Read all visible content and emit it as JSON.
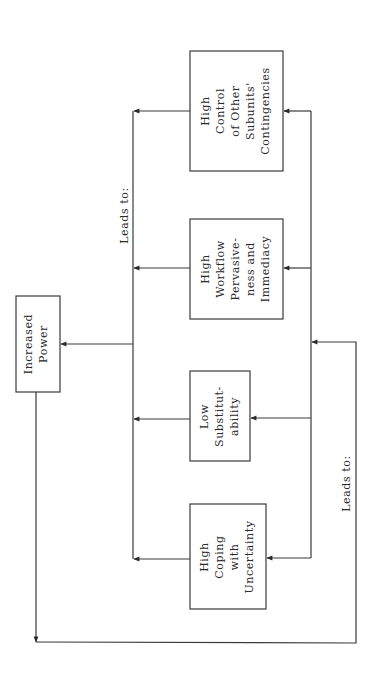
{
  "diagram": {
    "nodes": {
      "power": {
        "lines": [
          "Increased",
          "Power"
        ]
      },
      "coping": {
        "lines": [
          "High",
          "Coping",
          "with",
          "Uncertainty"
        ]
      },
      "substitutability": {
        "lines": [
          "Low",
          "Substitut-",
          "ability"
        ]
      },
      "workflow": {
        "lines": [
          "High",
          "Workflow",
          "Pervasive-",
          "ness and",
          "Immediacy"
        ]
      },
      "control": {
        "lines": [
          "High",
          "Control",
          "of Other",
          "Subunits'",
          "Contingencies"
        ]
      }
    },
    "labels": {
      "leads_to_top": "Leads to:",
      "leads_to_bottom": "Leads to:"
    },
    "edges": [
      {
        "from": "coping",
        "to": "power",
        "label": "Leads to:"
      },
      {
        "from": "substitutability",
        "to": "power",
        "label": "Leads to:"
      },
      {
        "from": "workflow",
        "to": "power",
        "label": "Leads to:"
      },
      {
        "from": "control",
        "to": "power",
        "label": "Leads to:"
      },
      {
        "from": "power",
        "to": "coping",
        "label": "Leads to:"
      },
      {
        "from": "power",
        "to": "substitutability",
        "label": "Leads to:"
      },
      {
        "from": "power",
        "to": "workflow",
        "label": "Leads to:"
      },
      {
        "from": "power",
        "to": "control",
        "label": "Leads to:"
      }
    ],
    "colors": {
      "line": "#3a3a3a",
      "background": "#ffffff"
    }
  }
}
